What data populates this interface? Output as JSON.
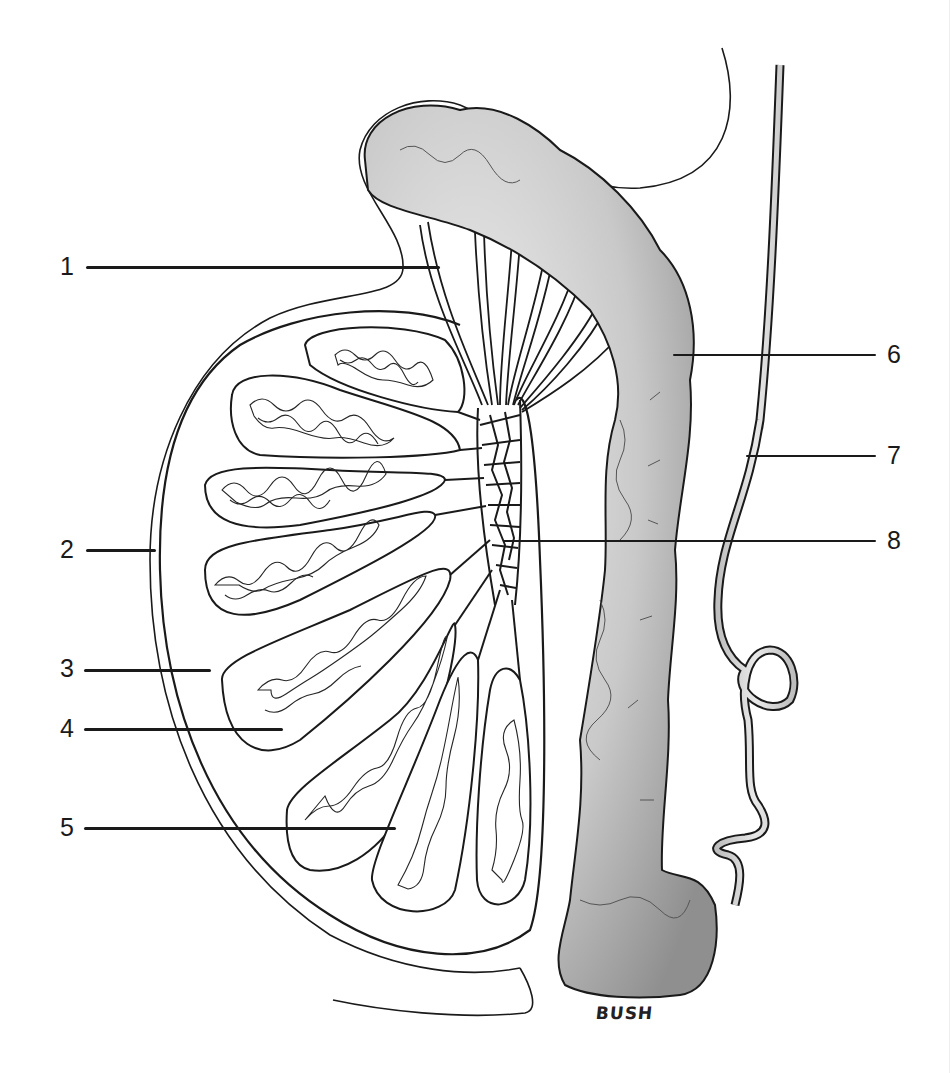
{
  "figure": {
    "signature": "BUSH",
    "colors": {
      "ink": "#1a1a1a",
      "shade": "#9a9a9a",
      "paper": "#ffffff"
    }
  },
  "callouts": [
    {
      "number": "1",
      "side": "left",
      "label_x": 60,
      "label_y": 254,
      "line_x1": 86,
      "line_x2": 440,
      "line_y": 266
    },
    {
      "number": "2",
      "side": "left",
      "label_x": 60,
      "label_y": 537,
      "line_x1": 86,
      "line_x2": 156,
      "line_y": 549
    },
    {
      "number": "3",
      "side": "left",
      "label_x": 60,
      "label_y": 656,
      "line_x1": 84,
      "line_x2": 211,
      "line_y": 669
    },
    {
      "number": "4",
      "side": "left",
      "label_x": 60,
      "label_y": 716,
      "line_x1": 84,
      "line_x2": 283,
      "line_y": 728
    },
    {
      "number": "5",
      "side": "left",
      "label_x": 60,
      "label_y": 815,
      "line_x1": 84,
      "line_x2": 396,
      "line_y": 827
    },
    {
      "number": "6",
      "side": "right",
      "label_x": 887,
      "label_y": 342,
      "line_x1": 673,
      "line_x2": 876,
      "line_y": 354
    },
    {
      "number": "7",
      "side": "right",
      "label_x": 887,
      "label_y": 443,
      "line_x1": 746,
      "line_x2": 876,
      "line_y": 455
    },
    {
      "number": "8",
      "side": "right",
      "label_x": 887,
      "label_y": 528,
      "line_x1": 503,
      "line_x2": 876,
      "line_y": 540
    }
  ]
}
